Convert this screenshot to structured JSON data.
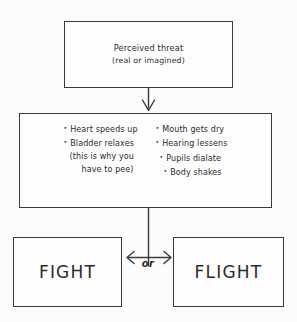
{
  "diagram": {
    "style": {
      "background_color": "#fcfcfc",
      "line_color": "#3a3a3a",
      "text_color": "#2b2b2b"
    },
    "threat_box": {
      "line1": "Perceived threat",
      "line2": "(real or imagined)"
    },
    "symptoms_box": {
      "left_column": [
        {
          "text": "Heart speeds up",
          "bullet": true
        },
        {
          "text": "Bladder relaxes",
          "bullet": true
        },
        {
          "text": "(this is why you",
          "bullet": false
        },
        {
          "text": "have to pee)",
          "bullet": false
        }
      ],
      "right_column": [
        {
          "text": "Mouth gets dry",
          "bullet": true
        },
        {
          "text": "Hearing lessens",
          "bullet": true
        },
        {
          "text": "Pupils dialate",
          "bullet": true
        },
        {
          "text": "Body shakes",
          "bullet": true
        }
      ]
    },
    "outcomes": {
      "left": "FIGHT",
      "right": "FLIGHT",
      "separator": "or"
    },
    "connectors": [
      {
        "name": "threat-to-symptoms-arrow",
        "type": "arrow-down"
      },
      {
        "name": "symptoms-to-outcomes-stem",
        "type": "line-vertical"
      },
      {
        "name": "fight-flight-double-arrow",
        "type": "arrow-double-horizontal"
      }
    ]
  }
}
